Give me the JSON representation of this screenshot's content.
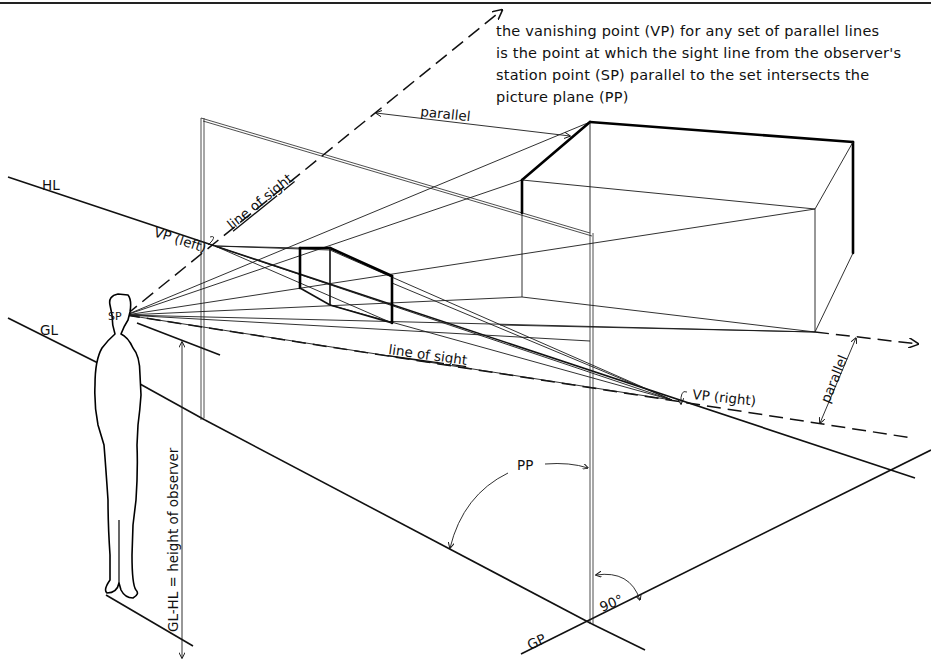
{
  "diagram": {
    "title_note": {
      "lines": [
        "the vanishing point (VP) for any set of parallel lines",
        "is the point at which the sight line from the observer's",
        "station point (SP) parallel to the set intersects the",
        "picture plane (PP)"
      ]
    },
    "labels": {
      "horizon_line": "HL",
      "ground_line": "GL",
      "station_point": "SP",
      "vp_left": "VP (left)",
      "vp_right": "VP (right)",
      "line_of_sight_upper": "line of sight",
      "line_of_sight_lower": "line of sight",
      "parallel_top": "parallel",
      "parallel_right": "parallel",
      "picture_plane": "PP",
      "ground_plane": "GP",
      "right_angle": "90°",
      "observer_height": "GL-HL = height of observer"
    },
    "colors": {
      "ink": "#111111",
      "paper": "#ffffff"
    }
  }
}
